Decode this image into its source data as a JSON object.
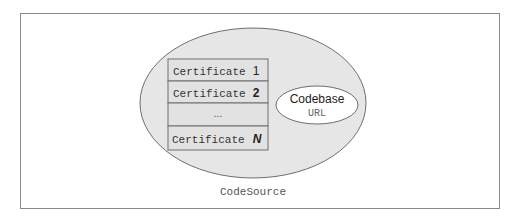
{
  "diagram": {
    "container_label": "CodeSource",
    "certificates": [
      {
        "label": "Certificate",
        "index": "1"
      },
      {
        "label": "Certificate",
        "index": "2"
      },
      {
        "label": "",
        "index": "..."
      },
      {
        "label": "Certificate",
        "index": "N"
      }
    ],
    "codebase": {
      "title": "Codebase",
      "subtitle": "URL"
    },
    "colors": {
      "outer_ellipse_fill": "#e6e6e6",
      "stroke": "#6e6e6e",
      "cert_fill": "#e2e2e2",
      "codebase_fill": "#ffffff",
      "text": "#333333"
    }
  }
}
